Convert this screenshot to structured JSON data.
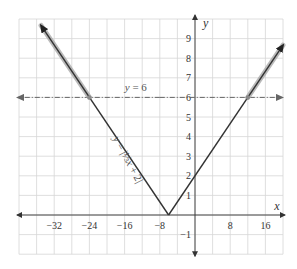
{
  "chart_data": {
    "type": "line",
    "title": "",
    "xlabel": "x",
    "ylabel": "y",
    "xlim": [
      -40,
      20
    ],
    "ylim": [
      -2,
      10
    ],
    "grid": true,
    "x_tick_step": 4,
    "y_tick_step": 1,
    "x_tick_labels": [
      "-32",
      "-24",
      "-16",
      "-8",
      "8",
      "16"
    ],
    "x_tick_values": [
      -32,
      -24,
      -16,
      -8,
      8,
      16
    ],
    "y_tick_labels": [
      "-1",
      "1",
      "2",
      "3",
      "4",
      "5",
      "6",
      "7",
      "8",
      "9"
    ],
    "y_tick_values": [
      -1,
      1,
      2,
      3,
      4,
      5,
      6,
      7,
      8,
      9
    ],
    "series": [
      {
        "name": "y = |1/3 x + 2|",
        "label_text": "y = |⅓x + 2|",
        "style": "solid",
        "color": "#333333",
        "x": [
          -35,
          -24,
          -6,
          12,
          20
        ],
        "y": [
          9.67,
          6,
          0,
          6,
          8.67
        ],
        "highlight_segments": [
          {
            "x": [
              -35,
              -24
            ],
            "y": [
              9.67,
              6
            ]
          },
          {
            "x": [
              12,
              20
            ],
            "y": [
              6,
              8.67
            ]
          }
        ],
        "highlight_color": "#aaaaaa"
      },
      {
        "name": "y = 6",
        "label_text": "y = 6",
        "style": "dash-dot",
        "color": "#666666",
        "x": [
          -40,
          20
        ],
        "y": [
          6,
          6
        ]
      }
    ],
    "points": [
      {
        "x": -24,
        "y": 6
      },
      {
        "x": 12,
        "y": 6
      }
    ],
    "annotations": [
      {
        "text": "y = 6",
        "x": -18,
        "y": 6.5
      },
      {
        "text": "y = |⅓x + 2|",
        "x": -18,
        "y": 3,
        "rotation": -62
      }
    ]
  }
}
